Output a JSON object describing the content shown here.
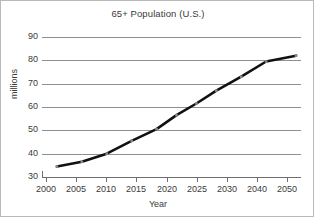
{
  "chart_data": {
    "type": "line",
    "title": "65+ Population (U.S.)",
    "xlabel": "Year",
    "ylabel": "millions",
    "grid": true,
    "legend": "none",
    "xlim": [
      2000,
      2052
    ],
    "ylim": [
      30,
      90
    ],
    "ytick_labels": [
      "90",
      "80",
      "70",
      "60",
      "50",
      "40",
      "30"
    ],
    "ytick_values": [
      90,
      80,
      70,
      60,
      50,
      40,
      30
    ],
    "xtick_labels": [
      "2000",
      "2005",
      "2010",
      "2015",
      "2020",
      "2025",
      "2030",
      "2040",
      "2050"
    ],
    "xtick_values": [
      2000,
      2005,
      2010,
      2015,
      2020,
      2025,
      2030,
      2040,
      2050
    ],
    "series": [
      {
        "name": "65+ population",
        "color": "#111111",
        "x": [
          2003,
          2008,
          2013,
          2018,
          2023,
          2027,
          2031,
          2035,
          2040,
          2045,
          2051
        ],
        "values": [
          34.5,
          36.5,
          40.0,
          45.5,
          50.5,
          56.5,
          61.5,
          67.0,
          73.0,
          79.5,
          82.0
        ]
      }
    ]
  }
}
